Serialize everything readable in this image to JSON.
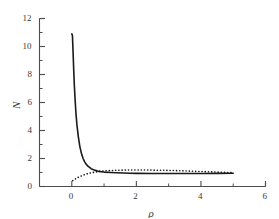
{
  "figure": {
    "background": "#ffffff",
    "axis_color": "#4d4d4d",
    "curve_color": "#1a1a1a"
  },
  "chart_data": {
    "type": "line",
    "title": "",
    "subtitle": "",
    "xlabel": "ρ",
    "ylabel": "N",
    "xlim": [
      -1,
      6
    ],
    "ylim": [
      0,
      12
    ],
    "xticks": [
      0,
      2,
      4,
      6
    ],
    "xticklabels": [
      "0",
      "2",
      "4",
      "6"
    ],
    "xminorticks": [
      1,
      3,
      5
    ],
    "yticks": [
      0,
      2,
      4,
      6,
      8,
      10,
      12
    ],
    "yticklabels": [
      "0",
      "2",
      "4",
      "6",
      "8",
      "10",
      "12"
    ],
    "yminorticks": [
      1,
      3,
      5,
      7,
      9,
      11
    ],
    "grid": false,
    "legend": null,
    "legend_position": "none",
    "annotations": [],
    "series": [
      {
        "name": "solid-curve",
        "style": "solid",
        "color": "#1a1a1a",
        "linewidth": 1.6,
        "x": [
          0.0,
          0.02,
          0.04,
          0.06,
          0.08,
          0.1,
          0.13,
          0.16,
          0.2,
          0.25,
          0.3,
          0.35,
          0.4,
          0.45,
          0.5,
          0.6,
          0.7,
          0.8,
          0.9,
          1.0,
          1.2,
          1.4,
          1.6,
          1.8,
          2.0,
          2.5,
          3.0,
          3.5,
          4.0,
          4.5,
          5.0
        ],
        "y": [
          10.9,
          10.8,
          9.6,
          8.3,
          7.2,
          6.3,
          5.2,
          4.4,
          3.6,
          2.85,
          2.35,
          2.0,
          1.76,
          1.58,
          1.45,
          1.27,
          1.17,
          1.1,
          1.06,
          1.03,
          1.0,
          0.98,
          0.96,
          0.95,
          0.94,
          0.93,
          0.93,
          0.93,
          0.93,
          0.94,
          0.95
        ]
      },
      {
        "name": "dotted-curve",
        "style": "dotted",
        "color": "#1a1a1a",
        "linewidth": 1.6,
        "x": [
          0.03,
          0.08,
          0.15,
          0.22,
          0.3,
          0.4,
          0.5,
          0.6,
          0.7,
          0.8,
          0.9,
          1.0,
          1.2,
          1.4,
          1.6,
          1.8,
          2.0,
          2.25,
          2.5,
          2.75,
          3.0,
          3.25,
          3.5,
          3.75,
          4.0,
          4.25,
          4.5,
          4.75,
          5.0
        ],
        "y": [
          0.42,
          0.5,
          0.6,
          0.68,
          0.76,
          0.85,
          0.92,
          0.98,
          1.02,
          1.06,
          1.09,
          1.11,
          1.14,
          1.16,
          1.17,
          1.18,
          1.18,
          1.18,
          1.17,
          1.16,
          1.15,
          1.13,
          1.11,
          1.09,
          1.07,
          1.05,
          1.03,
          1.01,
          0.99
        ]
      }
    ]
  }
}
